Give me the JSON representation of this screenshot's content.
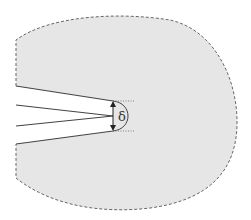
{
  "diagram": {
    "type": "crack-tip-opening-displacement",
    "label_delta": "δ",
    "colors": {
      "region_fill": "#e6e6e6",
      "boundary": "#666666",
      "crack_lines": "#444444",
      "arrow": "#222222"
    }
  }
}
